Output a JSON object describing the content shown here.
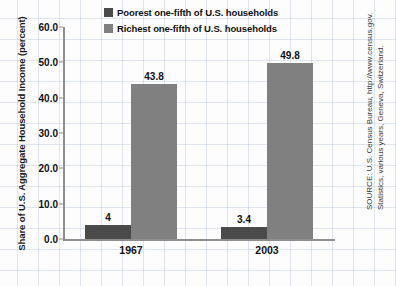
{
  "chart_data": {
    "type": "bar",
    "title": "",
    "xlabel": "",
    "ylabel": "Share of U.S. Aggregate Household Income (percent)",
    "categories": [
      "1967",
      "2003"
    ],
    "series": [
      {
        "name": "Poorest one-fifth of U.S. households",
        "color": "#4a4a4a",
        "values": [
          4,
          3.4
        ],
        "labels": [
          "4",
          "3.4"
        ]
      },
      {
        "name": "Richest one-fifth of U.S. households",
        "color": "#808080",
        "values": [
          43.8,
          49.8
        ],
        "labels": [
          "43.8",
          "49.8"
        ]
      }
    ],
    "ylim": [
      0,
      60
    ],
    "yticks": [
      0,
      10,
      20,
      30,
      40,
      50,
      60
    ],
    "ytick_labels": [
      "0.0",
      "10.0",
      "20.0",
      "30.0",
      "40.0",
      "50.0",
      "60.0"
    ],
    "grid": true,
    "legend_position": "top-center"
  },
  "legend": {
    "items": [
      {
        "label": "Poorest one-fifth of U.S. households",
        "color": "#4a4a4a"
      },
      {
        "label": "Richest one-fifth of U.S. households",
        "color": "#808080"
      }
    ]
  },
  "source": {
    "line1": "SOURCE: U.S. Census Bureau, http://www.census.gov.",
    "line2": "Statistics, various years, Geneva, Switzerland."
  }
}
